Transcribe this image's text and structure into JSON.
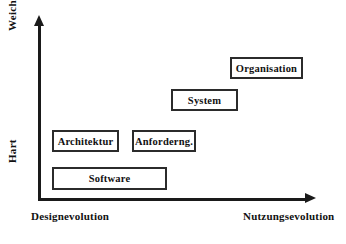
{
  "diagram": {
    "background_color": "#ffffff",
    "line_color": "#1a1a1a",
    "box_border_color": "#2b2b2b",
    "text_color": "#111111"
  },
  "axes": {
    "y": {
      "top_label": "Weich",
      "bottom_label": "Hart",
      "arrow": "arrow-up-icon"
    },
    "x": {
      "left_label": "Designevolution",
      "right_label": "Nutzungsevolution",
      "arrow": "arrow-right-icon"
    }
  },
  "nodes": [
    {
      "id": "software",
      "label": "Software"
    },
    {
      "id": "architektur",
      "label": "Architektur"
    },
    {
      "id": "anforderung",
      "label": "Anforderng."
    },
    {
      "id": "system",
      "label": "System"
    },
    {
      "id": "organisation",
      "label": "Organisation"
    }
  ]
}
